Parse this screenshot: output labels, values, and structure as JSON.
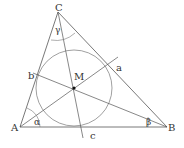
{
  "diagram": {
    "vertices": {
      "A": {
        "label": "A",
        "x": 20,
        "y": 127
      },
      "B": {
        "label": "B",
        "x": 167,
        "y": 127
      },
      "C": {
        "label": "C",
        "x": 58,
        "y": 12
      }
    },
    "incenter": {
      "label": "M",
      "x": 74,
      "y": 88
    },
    "incircle_radius": 38,
    "tangent_labels": {
      "a": "a",
      "b": "b",
      "c": "c"
    },
    "angles": {
      "alpha": "α",
      "beta": "β",
      "gamma": "γ"
    },
    "colors": {
      "line": "#555555",
      "circle": "#777777",
      "point": "#111111",
      "text": "#333333"
    }
  }
}
